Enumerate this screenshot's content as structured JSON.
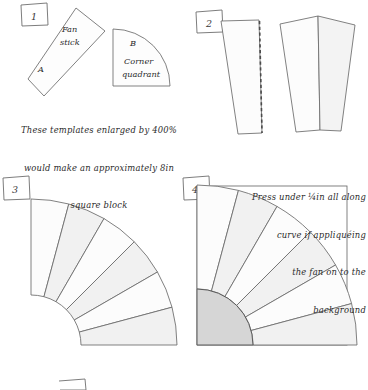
{
  "doc": {
    "title": "Fan block quilting template instructions",
    "background": "#ffffff",
    "ink": "#3a3a3a",
    "fill_light": "#fbfbfb",
    "fill_shade": "#f0f0f0",
    "fill_quadrant": "#d6d6d6"
  },
  "steps": [
    {
      "number": "1"
    },
    {
      "number": "2"
    },
    {
      "number": "3"
    },
    {
      "number": "4"
    },
    {
      "number": "5"
    }
  ],
  "templates": {
    "fan_stick": {
      "letter": "A",
      "name_line1": "Fan",
      "name_line2": "stick"
    },
    "corner_quadrant": {
      "letter": "B",
      "name_line1": "Corner",
      "name_line2": "quadrant"
    }
  },
  "captions": {
    "step1": {
      "line1": "These templates enlarged by 400%",
      "line2": "would make an approximately 8in",
      "line3": "square block"
    },
    "step4": {
      "line1": "Press under ¼in all along",
      "line2": "curve if appliquéing",
      "line3": "the fan on to the",
      "line4": "background"
    }
  },
  "fan": {
    "segment_count": 6,
    "span_degrees": 90
  }
}
